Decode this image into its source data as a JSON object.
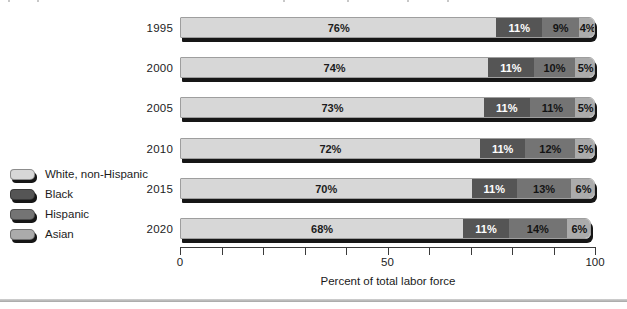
{
  "chart_data": {
    "type": "bar",
    "orientation": "horizontal",
    "stacked": true,
    "title": "",
    "xlabel": "Percent of total labor force",
    "xlim": [
      0,
      100
    ],
    "x_minor_tick_step": 10,
    "grid": false,
    "legend_position": "left-middle",
    "x_tick_labels": [
      {
        "pos": 0,
        "label": "0"
      },
      {
        "pos": 50,
        "label": "50"
      },
      {
        "pos": 100,
        "label": "100"
      }
    ],
    "categories": [
      "1995",
      "2000",
      "2005",
      "2010",
      "2015",
      "2020"
    ],
    "series": [
      {
        "name": "White, non-Hispanic",
        "color": "#d7d7d7",
        "text_color": "#1c1c1c",
        "values": [
          76,
          74,
          73,
          72,
          70,
          68
        ],
        "labels": [
          "76%",
          "74%",
          "73%",
          "72%",
          "70%",
          "68%"
        ]
      },
      {
        "name": "Black",
        "color": "#555555",
        "text_color": "#ffffff",
        "values": [
          11,
          11,
          11,
          11,
          11,
          11
        ],
        "labels": [
          "11%",
          "11%",
          "11%",
          "11%",
          "11%",
          "11%"
        ]
      },
      {
        "name": "Hispanic",
        "color": "#747474",
        "text_color": "#141414",
        "values": [
          9,
          10,
          11,
          12,
          13,
          14
        ],
        "labels": [
          "9%",
          "10%",
          "11%",
          "12%",
          "13%",
          "14%"
        ]
      },
      {
        "name": "Asian",
        "color": "#ababab",
        "text_color": "#141414",
        "values": [
          4,
          5,
          5,
          5,
          6,
          6
        ],
        "labels": [
          "4%",
          "5%",
          "5%",
          "5%",
          "6%",
          "6%"
        ]
      }
    ]
  },
  "legend": {
    "items": [
      {
        "label": "White, non-Hispanic",
        "color": "#d7d7d7"
      },
      {
        "label": "Black",
        "color": "#555555"
      },
      {
        "label": "Hispanic",
        "color": "#747474"
      },
      {
        "label": "Asian",
        "color": "#ababab"
      }
    ]
  },
  "colors": {
    "bar_shadow": "#161616",
    "axis": "#3a3a3a",
    "bottom_rule": "#b5b5b5",
    "background": "#ffffff"
  }
}
